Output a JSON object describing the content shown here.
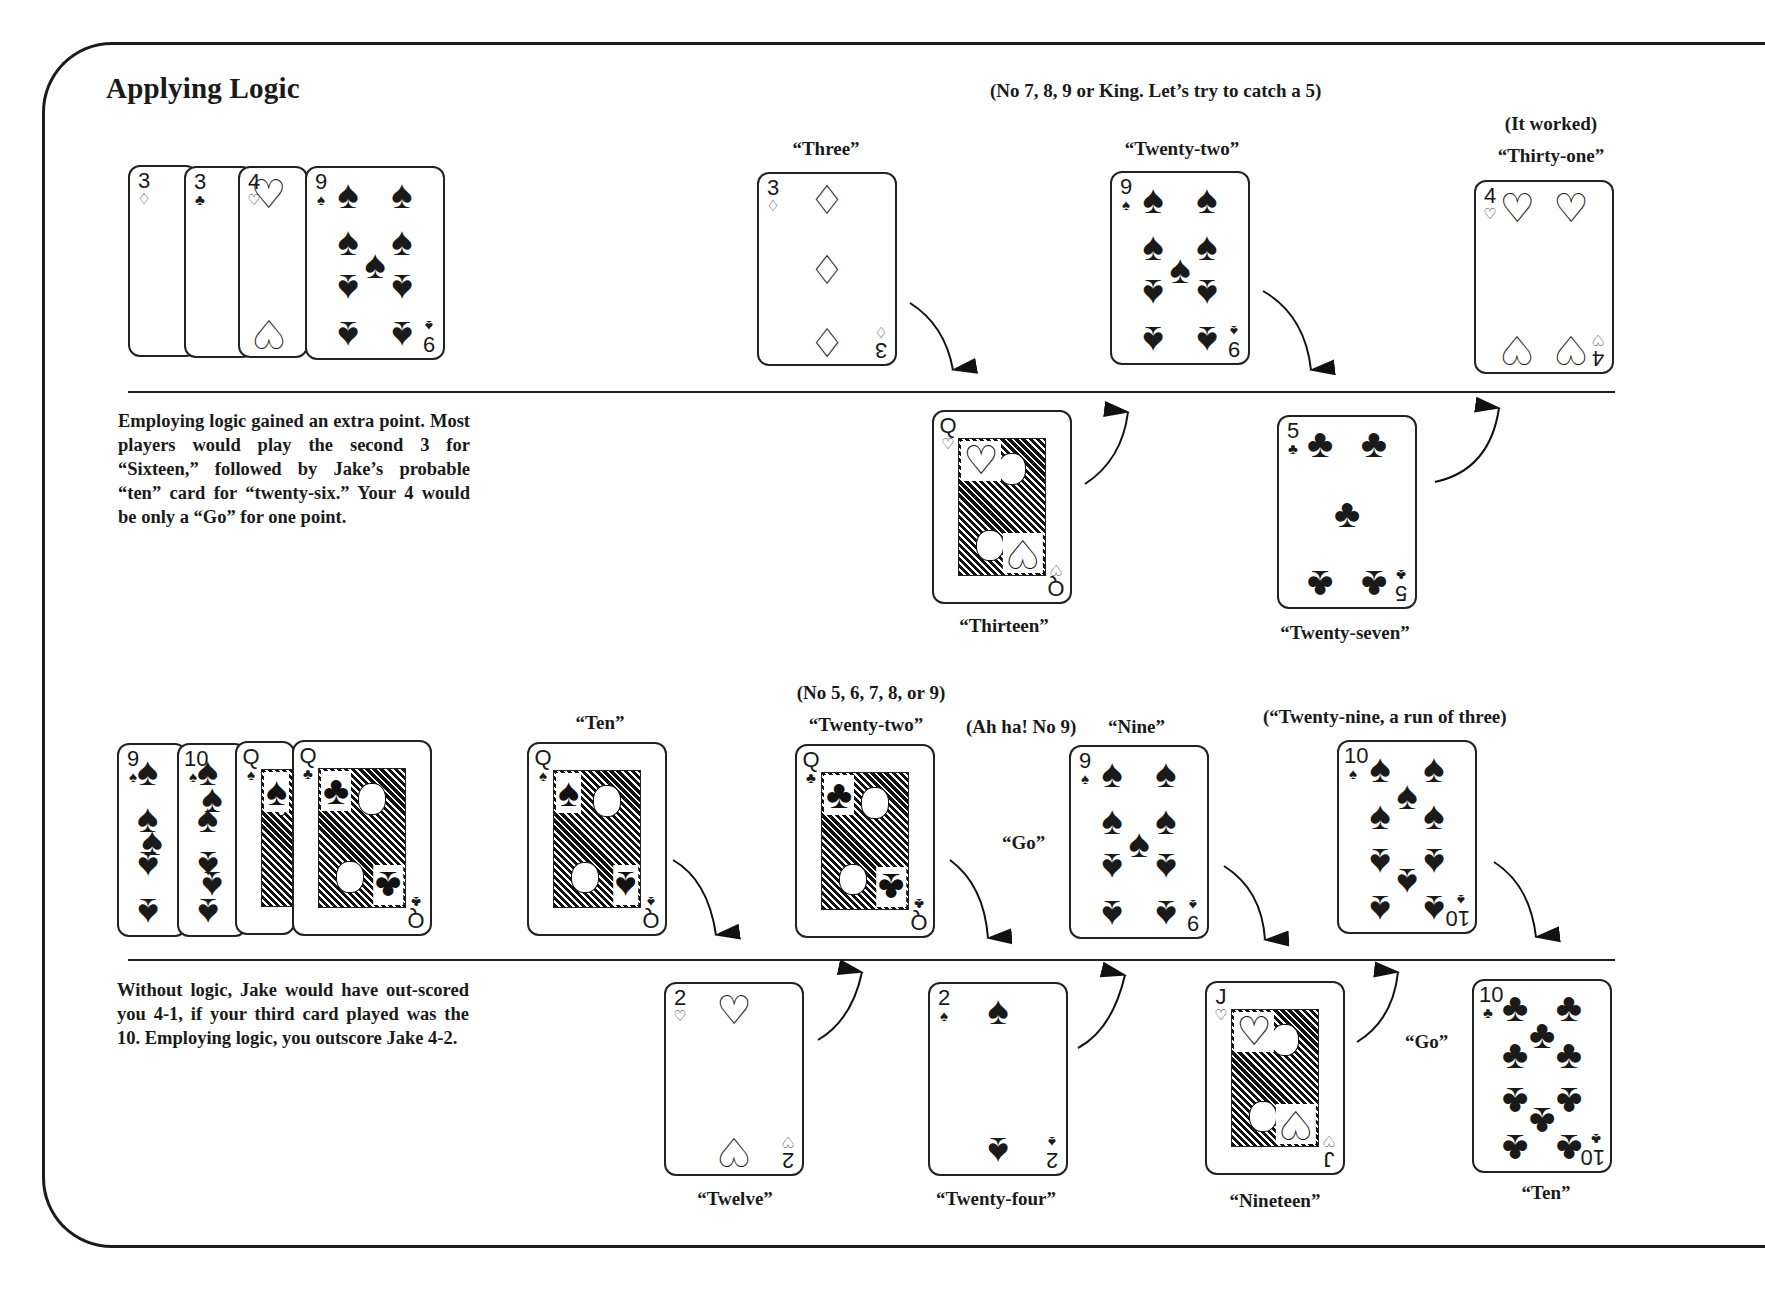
{
  "page": {
    "title": "Applying Logic"
  },
  "section1": {
    "hand": [
      {
        "rank": "3",
        "suit": "diamonds"
      },
      {
        "rank": "3",
        "suit": "clubs"
      },
      {
        "rank": "4",
        "suit": "hearts"
      },
      {
        "rank": "9",
        "suit": "spades"
      }
    ],
    "note_top": "(No 7, 8, 9 or King.   Let’s try to catch  a 5)",
    "note_worked": "(It worked)",
    "top_row": [
      {
        "rank": "3",
        "suit": "diamonds",
        "caption": "“Three”"
      },
      {
        "rank": "9",
        "suit": "spades",
        "caption": "“Twenty-two”"
      },
      {
        "rank": "4",
        "suit": "hearts",
        "caption": "“Thirty-one”"
      }
    ],
    "bottom_row": [
      {
        "rank": "Q",
        "suit": "hearts",
        "caption": "“Thirteen”"
      },
      {
        "rank": "5",
        "suit": "clubs",
        "caption": "“Twenty-seven”"
      }
    ],
    "paragraph": "Employing logic gained an extra point. Most players would play the second 3 for “Sixteen,” followed by Jake’s probable “ten” card for “twenty-six.” Your 4 would be only a “Go” for one point."
  },
  "section2": {
    "hand": [
      {
        "rank": "9",
        "suit": "spades"
      },
      {
        "rank": "10",
        "suit": "spades"
      },
      {
        "rank": "Q",
        "suit": "spades"
      },
      {
        "rank": "Q",
        "suit": "clubs"
      }
    ],
    "note_no": "(No 5, 6, 7, 8, or 9)",
    "note_ahha": "(Ah ha! No 9)",
    "note_run": "(“Twenty-nine, a run of three)",
    "go_label_top": "“Go”",
    "go_label_bottom": "“Go”",
    "top_row": [
      {
        "rank": "Q",
        "suit": "spades",
        "caption": "“Ten”"
      },
      {
        "rank": "Q",
        "suit": "clubs",
        "caption": "“Twenty-two”"
      },
      {
        "rank": "9",
        "suit": "spades",
        "caption": "“Nine”"
      },
      {
        "rank": "10",
        "suit": "spades",
        "caption": ""
      }
    ],
    "bottom_row": [
      {
        "rank": "2",
        "suit": "hearts",
        "caption": "“Twelve”"
      },
      {
        "rank": "2",
        "suit": "spades",
        "caption": "“Twenty-four”"
      },
      {
        "rank": "J",
        "suit": "hearts",
        "caption": "“Nineteen”"
      },
      {
        "rank": "10",
        "suit": "clubs",
        "caption": "“Ten”"
      }
    ],
    "paragraph": "Without logic, Jake would have out-scored you 4-1, if your third card played was the 10. Employing logic, you outscore Jake 4-2."
  },
  "suits": {
    "spades": "♠",
    "clubs": "♣",
    "hearts": "♡",
    "diamonds": "♢"
  },
  "colors": {
    "ink": "#1a1a1a",
    "paper": "#ffffff"
  }
}
